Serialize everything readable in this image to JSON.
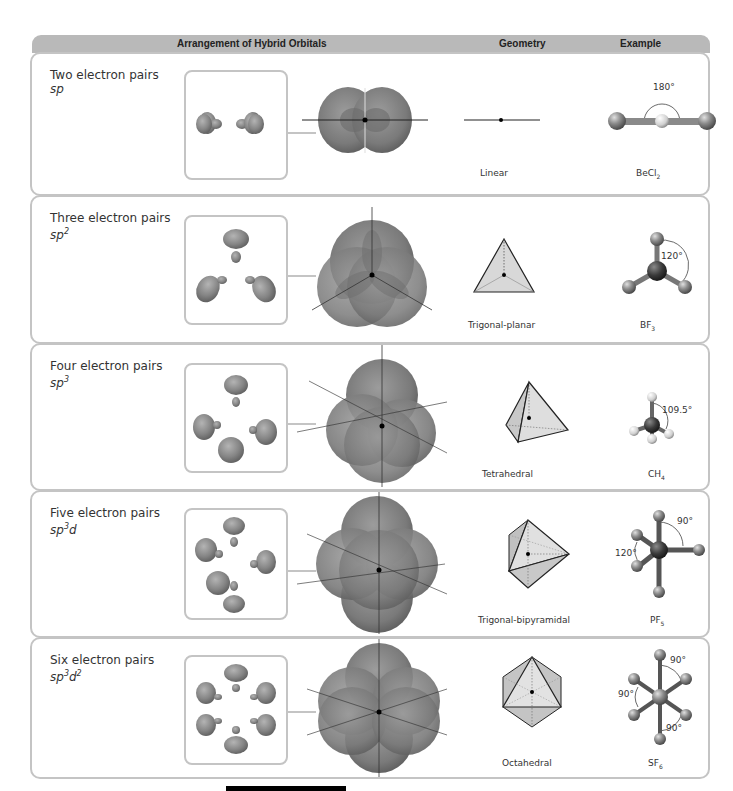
{
  "header": {
    "col_arrangement": "Arrangement of Hybrid Orbitals",
    "col_geometry": "Geometry",
    "col_example": "Example"
  },
  "rows": [
    {
      "pairs": "Two electron pairs",
      "hybrid_base": "sp",
      "hybrid_sup": "",
      "hybrid_tail": "",
      "geometry": "Linear",
      "example_base": "BeCl",
      "example_sub": "2",
      "angles": [
        "180°"
      ]
    },
    {
      "pairs": "Three electron pairs",
      "hybrid_base": "sp",
      "hybrid_sup": "2",
      "hybrid_tail": "",
      "geometry": "Trigonal-planar",
      "example_base": "BF",
      "example_sub": "3",
      "angles": [
        "120°"
      ]
    },
    {
      "pairs": "Four electron pairs",
      "hybrid_base": "sp",
      "hybrid_sup": "3",
      "hybrid_tail": "",
      "geometry": "Tetrahedral",
      "example_base": "CH",
      "example_sub": "4",
      "angles": [
        "109.5°"
      ]
    },
    {
      "pairs": "Five electron pairs",
      "hybrid_base": "sp",
      "hybrid_sup": "3",
      "hybrid_tail": "d",
      "geometry": "Trigonal-bipyramidal",
      "example_base": "PF",
      "example_sub": "5",
      "angles": [
        "90°",
        "120°"
      ]
    },
    {
      "pairs": "Six electron pairs",
      "hybrid_base": "sp",
      "hybrid_sup": "3",
      "hybrid_tail": "d",
      "hybrid_sup2": "2",
      "geometry": "Octahedral",
      "example_base": "SF",
      "example_sub": "6",
      "angles": [
        "90°",
        "90°",
        "90°"
      ]
    }
  ],
  "colors": {
    "header_bg": "#b9b9b9",
    "border": "#c4c4c4",
    "orbital": "#8a8a8a",
    "orbital_dark": "#5e5e5e",
    "geometry_fill": "#d8d8d8",
    "atom_light": "#a0a0a0",
    "atom_dark": "#3a3a3a"
  }
}
